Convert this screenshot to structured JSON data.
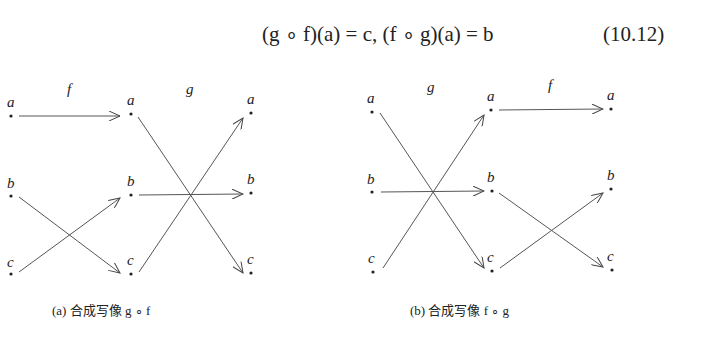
{
  "equation": {
    "text": "(g ∘ f)(a) = c,   (f ∘ g)(a) = b",
    "number": "(10.12)"
  },
  "diagram_a": {
    "caption": "(a)  合成写像  g ∘ f",
    "map_labels": [
      "f",
      "g"
    ],
    "columns": [
      {
        "nodes": [
          "a",
          "b",
          "c"
        ]
      },
      {
        "nodes": [
          "a",
          "b",
          "c"
        ]
      },
      {
        "nodes": [
          "a",
          "b",
          "c"
        ]
      }
    ],
    "f_mapping": {
      "a": "a",
      "b": "c",
      "c": "b"
    },
    "g_mapping": {
      "a": "c",
      "b": "b",
      "c": "a"
    }
  },
  "diagram_b": {
    "caption": "(b)  合成写像  f ∘ g",
    "map_labels": [
      "g",
      "f"
    ],
    "columns": [
      {
        "nodes": [
          "a",
          "b",
          "c"
        ]
      },
      {
        "nodes": [
          "a",
          "b",
          "c"
        ]
      },
      {
        "nodes": [
          "a",
          "b",
          "c"
        ]
      }
    ],
    "g_mapping": {
      "a": "c",
      "b": "b",
      "c": "a"
    },
    "f_mapping": {
      "a": "a",
      "b": "c",
      "c": "b"
    }
  },
  "labels": {
    "a": "a",
    "b": "b",
    "c": "c",
    "f": "f",
    "g": "g"
  }
}
